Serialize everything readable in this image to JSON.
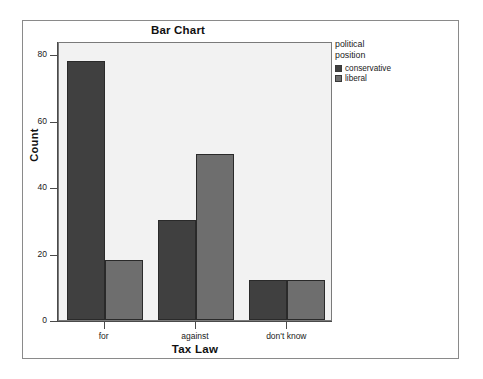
{
  "chart_data": {
    "type": "bar",
    "title": "Bar Chart",
    "xlabel": "Tax Law",
    "ylabel": "Count",
    "categories": [
      "for",
      "against",
      "don't know"
    ],
    "series": [
      {
        "name": "conservative",
        "color": "#404040",
        "values": [
          78,
          30,
          12
        ]
      },
      {
        "name": "liberal",
        "color": "#6e6e6e",
        "values": [
          18,
          50,
          12
        ]
      }
    ],
    "legend_title": "political\nposition",
    "legend_position": "right",
    "ylim": [
      0,
      84
    ],
    "yticks": [
      0,
      20,
      40,
      60,
      80
    ],
    "ytick_labels": [
      "0",
      "20",
      "40",
      "60",
      "80"
    ],
    "grid": false,
    "plot_background": "#f2f2f2",
    "axis_color": "#4a4a4a",
    "frame_color": "#8a8a8a"
  }
}
